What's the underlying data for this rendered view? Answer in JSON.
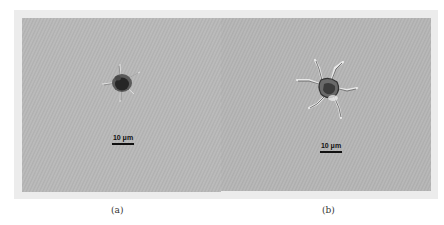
{
  "figure": {
    "panels": [
      {
        "id": "a",
        "label": "(a)",
        "scale_bar": "10 μm",
        "description": "small dark spiny cell with short projections"
      },
      {
        "id": "b",
        "label": "(b)",
        "scale_bar": "10 μm",
        "description": "star-shaped cell with long radiating arms"
      }
    ],
    "colors": {
      "background": "#b7b7b7",
      "frame": "#ececec",
      "cell_dark": "#2a2a2a",
      "scale_bar": "#111111"
    }
  }
}
